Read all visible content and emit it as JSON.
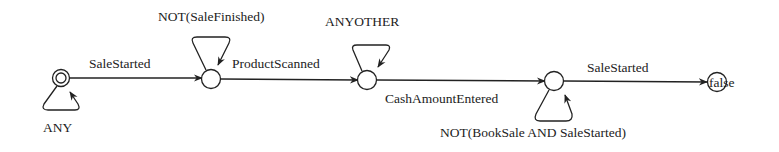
{
  "diagram": {
    "type": "state-machine",
    "states": [
      {
        "id": "s0",
        "label": "",
        "initial": true,
        "accepting": false
      },
      {
        "id": "s1",
        "label": ""
      },
      {
        "id": "s2",
        "label": ""
      },
      {
        "id": "s3",
        "label": ""
      },
      {
        "id": "s4",
        "label": "false"
      }
    ],
    "transitions": [
      {
        "from": "s0",
        "to": "s0",
        "label": "ANY"
      },
      {
        "from": "s0",
        "to": "s1",
        "label": "SaleStarted"
      },
      {
        "from": "s1",
        "to": "s1",
        "label": "NOT(SaleFinished)"
      },
      {
        "from": "s1",
        "to": "s2",
        "label": "ProductScanned"
      },
      {
        "from": "s2",
        "to": "s2",
        "label": "ANYOTHER"
      },
      {
        "from": "s2",
        "to": "s3",
        "label": "CashAmountEntered"
      },
      {
        "from": "s3",
        "to": "s3",
        "label": "NOT(BookSale AND SaleStarted)"
      },
      {
        "from": "s3",
        "to": "s4",
        "label": "SaleStarted"
      }
    ]
  }
}
